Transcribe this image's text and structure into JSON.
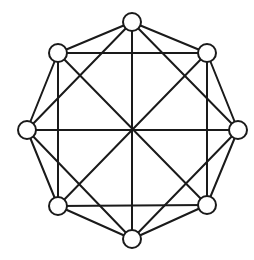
{
  "diagram": {
    "type": "graph",
    "colors": {
      "stroke": "#1a1a1a",
      "node_fill": "#ffffff",
      "background": "#ffffff"
    },
    "node_radius": 9,
    "center": [
      132,
      130
    ],
    "nodes": [
      {
        "id": "n0",
        "position": "top",
        "x": 132,
        "y": 22
      },
      {
        "id": "n1",
        "position": "top-right",
        "x": 207,
        "y": 53
      },
      {
        "id": "n2",
        "position": "right",
        "x": 238,
        "y": 130
      },
      {
        "id": "n3",
        "position": "bottom-right",
        "x": 207,
        "y": 205
      },
      {
        "id": "n4",
        "position": "bottom",
        "x": 132,
        "y": 239
      },
      {
        "id": "n5",
        "position": "bottom-left",
        "x": 58,
        "y": 206
      },
      {
        "id": "n6",
        "position": "left",
        "x": 27,
        "y": 130
      },
      {
        "id": "n7",
        "position": "top-left",
        "x": 58,
        "y": 53
      }
    ],
    "edges": [
      [
        "n0",
        "n1"
      ],
      [
        "n1",
        "n2"
      ],
      [
        "n2",
        "n3"
      ],
      [
        "n3",
        "n4"
      ],
      [
        "n4",
        "n5"
      ],
      [
        "n5",
        "n6"
      ],
      [
        "n6",
        "n7"
      ],
      [
        "n7",
        "n0"
      ],
      [
        "n0",
        "n2"
      ],
      [
        "n2",
        "n4"
      ],
      [
        "n4",
        "n6"
      ],
      [
        "n6",
        "n0"
      ],
      [
        "n1",
        "n3"
      ],
      [
        "n3",
        "n5"
      ],
      [
        "n5",
        "n7"
      ],
      [
        "n7",
        "n1"
      ],
      [
        "n0",
        "n4"
      ],
      [
        "n1",
        "n5"
      ],
      [
        "n2",
        "n6"
      ],
      [
        "n3",
        "n7"
      ]
    ]
  }
}
